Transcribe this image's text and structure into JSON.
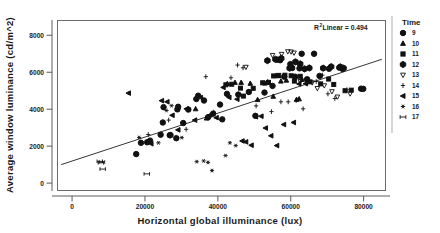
{
  "chart_data": {
    "type": "scatter",
    "title": "",
    "xlabel": "Horizontal global illuminance (lux)",
    "ylabel": "Average window luminance (cd/m^2)",
    "xlim": [
      -4000,
      86000
    ],
    "ylim": [
      -400,
      8800
    ],
    "xticks": [
      0,
      20000,
      40000,
      60000,
      80000
    ],
    "xtick_labels": [
      "0",
      "20000",
      "40000",
      "60000",
      "80000"
    ],
    "yticks": [
      0,
      2000,
      4000,
      6000,
      8000
    ],
    "ytick_labels": [
      "0",
      "2000",
      "4000",
      "6000",
      "8000"
    ],
    "grid": false,
    "legend_position": "right",
    "legend_title": "Time",
    "annotations": [
      {
        "text_prefix": "R",
        "text_sup": "2",
        "text_suffix": " Linear = 0.494",
        "x": 70000,
        "y": 8400
      }
    ],
    "fit_line": {
      "type": "linear",
      "label": "R^2 Linear = 0.494",
      "r_squared": 0.494,
      "x_start": -3000,
      "y_start": 1000,
      "x_end": 85000,
      "y_end": 6700
    },
    "series": [
      {
        "name": "9",
        "marker": "circle-filled",
        "points": [
          [
            17600,
            1570
          ],
          [
            18900,
            2180
          ],
          [
            20600,
            2210
          ],
          [
            21400,
            2300
          ],
          [
            24300,
            2620
          ],
          [
            24900,
            3280
          ],
          [
            25100,
            4110
          ],
          [
            26800,
            2590
          ],
          [
            27000,
            2600
          ],
          [
            28600,
            2430
          ],
          [
            28900,
            3990
          ],
          [
            29100,
            4130
          ],
          [
            30500,
            3250
          ],
          [
            31900,
            3980
          ],
          [
            34100,
            4550
          ],
          [
            34600,
            4730
          ],
          [
            36200,
            4470
          ],
          [
            37300,
            3560
          ],
          [
            38700,
            3760
          ],
          [
            40600,
            4250
          ],
          [
            41200,
            3450
          ],
          [
            42500,
            4830
          ],
          [
            45600,
            4790
          ],
          [
            48500,
            4930
          ],
          [
            50300,
            3640
          ],
          [
            52800,
            4900
          ],
          [
            55000,
            5260
          ],
          [
            56300,
            6680
          ],
          [
            57100,
            6650
          ],
          [
            58200,
            5760
          ],
          [
            59900,
            6440
          ],
          [
            60400,
            6230
          ],
          [
            61200,
            5760
          ],
          [
            62400,
            6210
          ],
          [
            63000,
            7000
          ],
          [
            64500,
            5620
          ],
          [
            66400,
            7000
          ],
          [
            67900,
            5800
          ],
          [
            70500,
            6190
          ],
          [
            73300,
            6250
          ],
          [
            74200,
            6180
          ],
          [
            79300,
            5110
          ],
          [
            79900,
            5100
          ]
        ]
      },
      {
        "name": "10",
        "marker": "triangle-up",
        "points": [
          [
            33900,
            4010
          ],
          [
            36900,
            3510
          ],
          [
            42600,
            5380
          ],
          [
            44700,
            5440
          ],
          [
            46400,
            5440
          ],
          [
            48900,
            5390
          ],
          [
            50900,
            4510
          ],
          [
            52900,
            5400
          ],
          [
            53700,
            5470
          ],
          [
            55200,
            4690
          ],
          [
            55900,
            5810
          ],
          [
            56600,
            5800
          ],
          [
            57300,
            5510
          ],
          [
            58800,
            5560
          ],
          [
            61600,
            4520
          ],
          [
            62300,
            4550
          ],
          [
            63100,
            5600
          ]
        ]
      },
      {
        "name": "11",
        "marker": "square-filled",
        "points": [
          [
            42200,
            5320
          ],
          [
            43800,
            5350
          ],
          [
            46200,
            5140
          ],
          [
            47000,
            4710
          ],
          [
            49700,
            5130
          ],
          [
            52300,
            5430
          ],
          [
            53900,
            5450
          ],
          [
            55300,
            5800
          ],
          [
            56700,
            5830
          ],
          [
            58400,
            5840
          ],
          [
            60100,
            5810
          ],
          [
            61000,
            5520
          ],
          [
            62600,
            5780
          ],
          [
            65300,
            5480
          ],
          [
            68200,
            5370
          ],
          [
            70400,
            5630
          ],
          [
            71800,
            5340
          ],
          [
            74900,
            5000
          ],
          [
            76600,
            5030
          ]
        ]
      },
      {
        "name": "12",
        "marker": "hexagon-filled",
        "points": [
          [
            53600,
            6630
          ],
          [
            55800,
            6700
          ],
          [
            57400,
            6750
          ],
          [
            59700,
            6220
          ],
          [
            61300,
            6560
          ],
          [
            62600,
            6450
          ],
          [
            63800,
            6180
          ],
          [
            65100,
            6230
          ],
          [
            68900,
            6220
          ],
          [
            71100,
            6300
          ],
          [
            73600,
            6290
          ],
          [
            74500,
            6220
          ]
        ]
      },
      {
        "name": "13",
        "marker": "triangle-down",
        "points": [
          [
            47700,
            6280
          ],
          [
            55000,
            6920
          ],
          [
            57500,
            6980
          ],
          [
            59200,
            7120
          ],
          [
            60100,
            7110
          ],
          [
            60900,
            7050
          ],
          [
            62600,
            5510
          ],
          [
            64300,
            5570
          ],
          [
            65900,
            5440
          ],
          [
            67300,
            5130
          ],
          [
            69200,
            5280
          ],
          [
            71300,
            4960
          ],
          [
            72800,
            4670
          ],
          [
            76300,
            4840
          ]
        ]
      },
      {
        "name": "14",
        "marker": "cross-thin",
        "points": [
          [
            20900,
            2630
          ],
          [
            26500,
            3410
          ],
          [
            31300,
            2910
          ],
          [
            36700,
            5760
          ],
          [
            38900,
            3840
          ],
          [
            43600,
            5700
          ],
          [
            45400,
            6390
          ],
          [
            46900,
            6240
          ],
          [
            50500,
            4180
          ],
          [
            54700,
            3870
          ],
          [
            57300,
            4400
          ],
          [
            59300,
            4400
          ],
          [
            61500,
            4470
          ],
          [
            63400,
            4020
          ],
          [
            64700,
            5510
          ],
          [
            67000,
            5500
          ],
          [
            68700,
            5840
          ],
          [
            70200,
            4830
          ],
          [
            72100,
            4580
          ],
          [
            75400,
            5050
          ]
        ]
      },
      {
        "name": "15",
        "marker": "triangle-left",
        "points": [
          [
            15500,
            4870
          ],
          [
            21700,
            2130
          ],
          [
            24600,
            4460
          ],
          [
            26100,
            4400
          ],
          [
            27500,
            3670
          ],
          [
            29100,
            2880
          ],
          [
            31400,
            4020
          ],
          [
            33700,
            3410
          ],
          [
            35300,
            4630
          ],
          [
            37900,
            3690
          ],
          [
            39600,
            3540
          ],
          [
            41500,
            5180
          ],
          [
            43100,
            4640
          ],
          [
            45300,
            4540
          ],
          [
            46700,
            2280
          ],
          [
            47700,
            2230
          ],
          [
            49200,
            2050
          ],
          [
            50400,
            3590
          ],
          [
            51900,
            3620
          ],
          [
            53100,
            2980
          ],
          [
            54600,
            2560
          ],
          [
            56200,
            2030
          ],
          [
            58100,
            3170
          ],
          [
            60800,
            3280
          ],
          [
            62300,
            5370
          ],
          [
            64100,
            5380
          ]
        ]
      },
      {
        "name": "16",
        "marker": "asterisk",
        "points": [
          [
            18400,
            2470
          ],
          [
            23700,
            2180
          ],
          [
            25900,
            3930
          ],
          [
            27300,
            4190
          ],
          [
            30100,
            2460
          ],
          [
            34200,
            1160
          ],
          [
            36100,
            1200
          ],
          [
            37300,
            1120
          ],
          [
            38400,
            680
          ],
          [
            42100,
            1490
          ],
          [
            43300,
            2180
          ],
          [
            44900,
            2030
          ]
        ]
      },
      {
        "name": "17",
        "marker": "dumbbell",
        "points": [
          [
            7600,
            1180
          ],
          [
            7900,
            1100
          ],
          [
            8200,
            1140
          ],
          [
            8400,
            760
          ],
          [
            20500,
            500
          ]
        ]
      }
    ]
  },
  "legend": {
    "title": "Time",
    "items": [
      {
        "label": "9",
        "marker": "circle-filled"
      },
      {
        "label": "10",
        "marker": "triangle-up"
      },
      {
        "label": "11",
        "marker": "square-filled"
      },
      {
        "label": "12",
        "marker": "hexagon-filled"
      },
      {
        "label": "13",
        "marker": "triangle-down"
      },
      {
        "label": "14",
        "marker": "cross-thin"
      },
      {
        "label": "15",
        "marker": "triangle-left"
      },
      {
        "label": "16",
        "marker": "asterisk"
      },
      {
        "label": "17",
        "marker": "dumbbell"
      }
    ]
  },
  "annotation": {
    "r2_prefix": "R",
    "r2_sup": "2",
    "r2_text": " Linear = 0.494"
  },
  "axes": {
    "x_title": "Horizontal global illuminance (lux)",
    "y_title": "Average window luminance (cd/m^2)",
    "x_tick_labels": [
      "0",
      "20000",
      "40000",
      "60000",
      "80000"
    ],
    "y_tick_labels": [
      "0",
      "2000",
      "4000",
      "6000",
      "8000"
    ]
  }
}
